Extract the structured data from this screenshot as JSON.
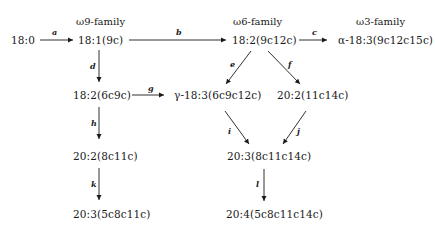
{
  "diagram": {
    "families": {
      "omega9": "ω9-family",
      "omega6": "ω6-family",
      "omega3": "ω3-family"
    },
    "nodes": {
      "n18_0": "18:0",
      "n18_1": "18:1(9c)",
      "n18_2_w6": "18:2(9c12c)",
      "n18_3_alpha": "α-18:3(9c12c15c)",
      "n18_2_6c9c": "18:2(6c9c)",
      "n18_3_gamma": "γ-18:3(6c9c12c)",
      "n20_2_11c14c": "20:2(11c14c)",
      "n20_2_8c11c": "20:2(8c11c)",
      "n20_3_8c11c14c": "20:3(8c11c14c)",
      "n20_3_5c8c11c": "20:3(5c8c11c)",
      "n20_4": "20:4(5c8c11c14c)"
    },
    "edges": [
      {
        "label": "a",
        "from": "18:0",
        "to": "18:1(9c)"
      },
      {
        "label": "b",
        "from": "18:1(9c)",
        "to": "18:2(9c12c)"
      },
      {
        "label": "c",
        "from": "18:2(9c12c)",
        "to": "α-18:3(9c12c15c)"
      },
      {
        "label": "d",
        "from": "18:1(9c)",
        "to": "18:2(6c9c)"
      },
      {
        "label": "e",
        "from": "18:2(9c12c)",
        "to": "γ-18:3(6c9c12c)"
      },
      {
        "label": "f",
        "from": "18:2(9c12c)",
        "to": "20:2(11c14c)"
      },
      {
        "label": "g",
        "from": "18:2(6c9c)",
        "to": "γ-18:3(6c9c12c)"
      },
      {
        "label": "h",
        "from": "18:2(6c9c)",
        "to": "20:2(8c11c)"
      },
      {
        "label": "i",
        "from": "γ-18:3(6c9c12c)",
        "to": "20:3(8c11c14c)"
      },
      {
        "label": "j",
        "from": "20:2(11c14c)",
        "to": "20:3(8c11c14c)"
      },
      {
        "label": "k",
        "from": "20:2(8c11c)",
        "to": "20:3(5c8c11c)"
      },
      {
        "label": "l",
        "from": "20:3(8c11c14c)",
        "to": "20:4(5c8c11c14c)"
      }
    ]
  }
}
